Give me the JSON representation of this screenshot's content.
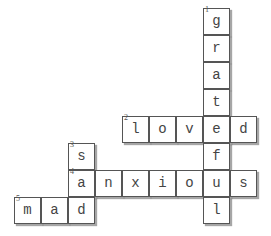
{
  "puzzle": {
    "cell_size": 27,
    "origin": {
      "x": 14,
      "y": 8
    },
    "words": [
      {
        "number": 1,
        "answer": "grateful",
        "direction": "down",
        "row": 0,
        "col": 7
      },
      {
        "number": 2,
        "answer": "loved",
        "direction": "across",
        "row": 4,
        "col": 4
      },
      {
        "number": 3,
        "answer": "sad",
        "direction": "down",
        "row": 5,
        "col": 2
      },
      {
        "number": 4,
        "answer": "anxious",
        "direction": "across",
        "row": 6,
        "col": 2
      },
      {
        "number": 5,
        "answer": "mad",
        "direction": "across",
        "row": 7,
        "col": 0
      }
    ]
  },
  "cells": [
    {
      "r": 0,
      "c": 7,
      "l": "g",
      "n": "1"
    },
    {
      "r": 1,
      "c": 7,
      "l": "r"
    },
    {
      "r": 2,
      "c": 7,
      "l": "a"
    },
    {
      "r": 3,
      "c": 7,
      "l": "t"
    },
    {
      "r": 4,
      "c": 4,
      "l": "l",
      "n": "2"
    },
    {
      "r": 4,
      "c": 5,
      "l": "o"
    },
    {
      "r": 4,
      "c": 6,
      "l": "v"
    },
    {
      "r": 4,
      "c": 7,
      "l": "e"
    },
    {
      "r": 4,
      "c": 8,
      "l": "d"
    },
    {
      "r": 5,
      "c": 2,
      "l": "s",
      "n": "3"
    },
    {
      "r": 5,
      "c": 7,
      "l": "f"
    },
    {
      "r": 6,
      "c": 2,
      "l": "a",
      "n": "4"
    },
    {
      "r": 6,
      "c": 3,
      "l": "n"
    },
    {
      "r": 6,
      "c": 4,
      "l": "x"
    },
    {
      "r": 6,
      "c": 5,
      "l": "i"
    },
    {
      "r": 6,
      "c": 6,
      "l": "o"
    },
    {
      "r": 6,
      "c": 7,
      "l": "u"
    },
    {
      "r": 6,
      "c": 8,
      "l": "s"
    },
    {
      "r": 7,
      "c": 0,
      "l": "m",
      "n": "5"
    },
    {
      "r": 7,
      "c": 1,
      "l": "a"
    },
    {
      "r": 7,
      "c": 2,
      "l": "d"
    },
    {
      "r": 7,
      "c": 7,
      "l": "l"
    }
  ]
}
